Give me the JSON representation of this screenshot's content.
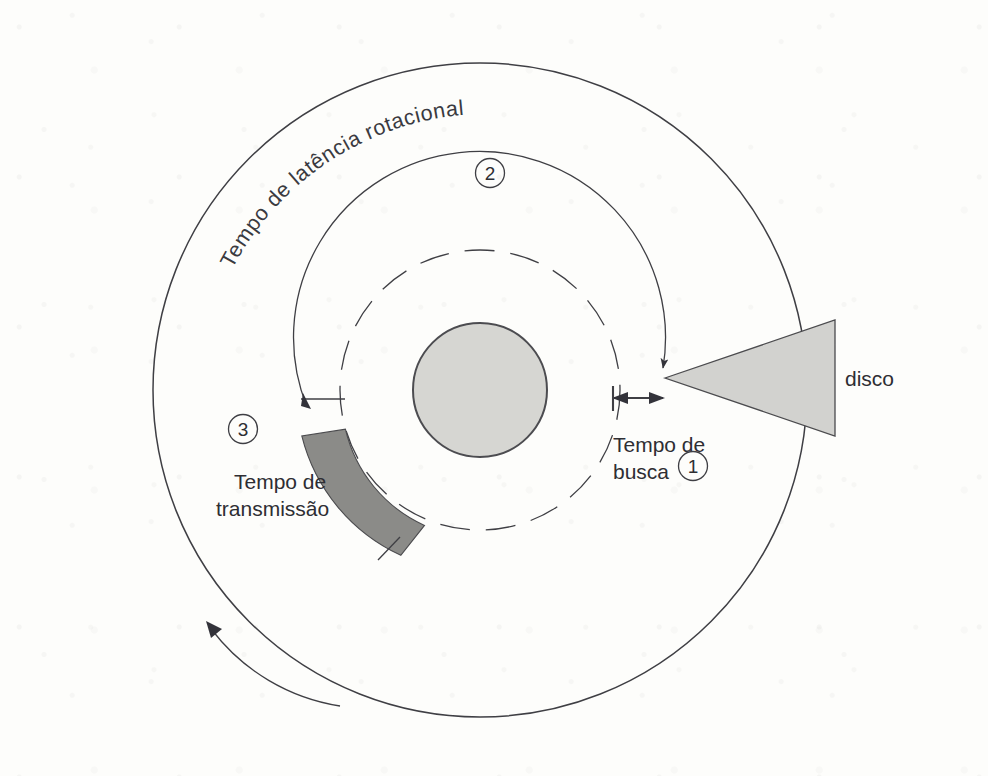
{
  "figure": {
    "background_color": "#fdfdfb",
    "ink_color": "#3f3f44"
  },
  "labels": {
    "rotational_latency": "Tempo de latência rotacional",
    "seek_time_line1": "Tempo de",
    "seek_time_line2": "busca",
    "transmission_line1": "Tempo de",
    "transmission_line2": "transmissão",
    "disk_arm": "disco"
  },
  "markers": {
    "one": "1",
    "two": "2",
    "three": "3"
  },
  "geometry": {
    "center_x": 480,
    "center_y": 390,
    "outer_radius": 327,
    "track_radius": 140,
    "hub_radius": 67,
    "sector_start_deg": 196,
    "sector_end_deg": 247
  },
  "colors": {
    "hub_fill": "#d6d6d2",
    "arm_fill": "#d2d2cf",
    "transmission_fill": "#8b8b88",
    "stroke": "#3f3f44"
  },
  "steps": [
    {
      "number": "1",
      "name": "Tempo de busca"
    },
    {
      "number": "2",
      "name": "Tempo de latência rotacional"
    },
    {
      "number": "3",
      "name": "Tempo de transmissão"
    }
  ]
}
